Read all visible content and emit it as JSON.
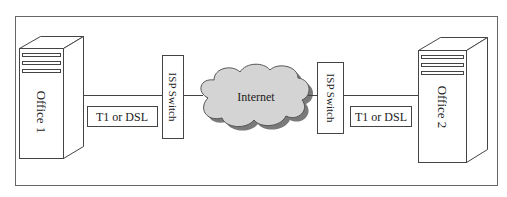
{
  "diagram": {
    "type": "network-topology",
    "frame": {
      "stroke": "#666666"
    },
    "nodes": [
      {
        "id": "office1",
        "kind": "server-tower",
        "label": "Office 1"
      },
      {
        "id": "isp1",
        "kind": "switch",
        "label": "ISP Switch"
      },
      {
        "id": "internet",
        "kind": "cloud",
        "label": "Internet"
      },
      {
        "id": "isp2",
        "kind": "switch",
        "label": "ISP Switch"
      },
      {
        "id": "office2",
        "kind": "server-tower",
        "label": "Office 2"
      }
    ],
    "links": [
      {
        "from": "office1",
        "to": "isp1",
        "label": "T1 or DSL"
      },
      {
        "from": "isp1",
        "to": "internet",
        "label": ""
      },
      {
        "from": "internet",
        "to": "isp2",
        "label": ""
      },
      {
        "from": "isp2",
        "to": "office2",
        "label": "T1 or DSL"
      }
    ],
    "colors": {
      "line": "#444444",
      "cloud_fill": "#d4d4d4",
      "cloud_shadow": "#7a7a7a",
      "background": "#ffffff"
    }
  }
}
